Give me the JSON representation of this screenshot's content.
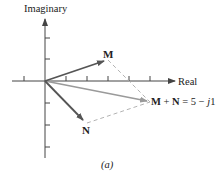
{
  "figure": {
    "caption": "(a)",
    "axes": {
      "x_label": "Real",
      "y_label": "Imaginary",
      "origin_px": [
        45,
        81
      ],
      "unit_px": 21,
      "x_ticks": [
        -1,
        1,
        2,
        3,
        4,
        5
      ],
      "y_ticks": [
        2,
        1,
        -1,
        -2,
        -3
      ]
    },
    "phasors": [
      {
        "name": "M",
        "label": "M",
        "real": 3,
        "imag": 1,
        "color": "#555555"
      },
      {
        "name": "N",
        "label": "N",
        "real": 2,
        "imag": -2,
        "color": "#555555"
      },
      {
        "name": "M+N",
        "label": "M + N = 5 − j1",
        "real": 5,
        "imag": -1,
        "color": "#9a9a9a"
      }
    ],
    "sum_label": {
      "M": "M",
      "plus": " + ",
      "N": "N",
      "eq": " = 5 − ",
      "j": "j",
      "one": "1"
    },
    "colors": {
      "axis": "#444444",
      "phasor": "#555555",
      "resultant": "#9a9a9a",
      "dashed": "#aaaaaa"
    }
  }
}
